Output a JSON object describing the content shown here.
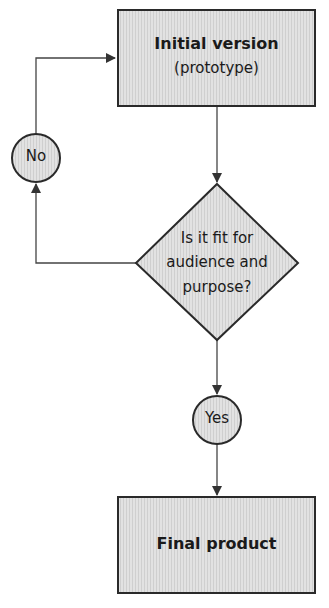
{
  "diagram": {
    "type": "flowchart",
    "nodes": {
      "initial": {
        "shape": "rectangle",
        "title": "Initial version",
        "subtitle": "(prototype)"
      },
      "decision": {
        "shape": "diamond",
        "line1": "Is it fit for",
        "line2": "audience and",
        "line3": "purpose?"
      },
      "no": {
        "shape": "circle",
        "label": "No"
      },
      "yes": {
        "shape": "circle",
        "label": "Yes"
      },
      "final": {
        "shape": "rectangle",
        "title": "Final product"
      }
    },
    "edges": [
      {
        "from": "initial",
        "to": "decision"
      },
      {
        "from": "decision",
        "to": "no"
      },
      {
        "from": "no",
        "to": "initial"
      },
      {
        "from": "decision",
        "to": "yes"
      },
      {
        "from": "yes",
        "to": "final"
      }
    ],
    "colors": {
      "fill": "#dcdcdc",
      "stroke": "#2a2a2a",
      "line": "#444444",
      "text": "#1a1a1a"
    }
  }
}
